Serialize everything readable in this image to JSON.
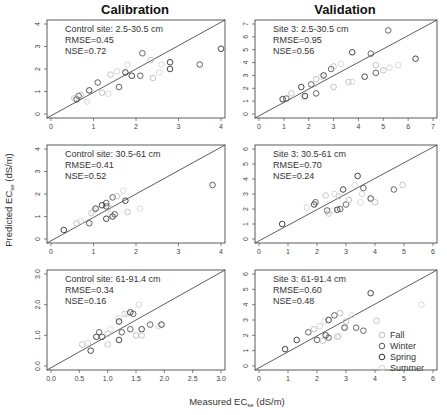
{
  "titles": {
    "left": "Calibration",
    "right": "Validation"
  },
  "axes": {
    "xlabel": "Measured EC",
    "xlabel_sub": "se",
    "xlabel_unit": " (dS/m)",
    "ylabel": "Predicted EC",
    "ylabel_sub": "se",
    "ylabel_unit": " (dS/m)"
  },
  "legend": [
    {
      "label": "Fall",
      "color": "#bdbdbd"
    },
    {
      "label": "Winter",
      "color": "#555555"
    },
    {
      "label": "Spring",
      "color": "#333333"
    },
    {
      "label": "Summer",
      "color": "#d5d5d5"
    }
  ],
  "chart_data": [
    {
      "type": "scatter",
      "id": "p1",
      "title": "Control site: 2.5-30.5 cm",
      "rmse": "RMSE=0.45",
      "nse": "NSE=0.72",
      "xlim": [
        0,
        4
      ],
      "ylim": [
        0,
        4
      ],
      "xticks": [
        "0",
        "1",
        "2",
        "3",
        "4"
      ],
      "yticks": [
        "0",
        "1",
        "2",
        "3",
        "4"
      ],
      "points": [
        [
          0.6,
          0.65
        ],
        [
          0.65,
          0.8
        ],
        [
          0.7,
          0.85
        ],
        [
          0.85,
          0.55
        ],
        [
          0.9,
          1.05
        ],
        [
          1.1,
          1.4
        ],
        [
          1.4,
          1.75
        ],
        [
          1.55,
          1.9
        ],
        [
          1.75,
          1.85
        ],
        [
          2.15,
          2.7
        ],
        [
          2.35,
          2.4
        ],
        [
          2.55,
          1.85
        ],
        [
          2.8,
          2.0
        ],
        [
          1.6,
          1.2
        ],
        [
          1.2,
          0.95
        ],
        [
          1.35,
          0.9
        ],
        [
          1.9,
          1.7
        ],
        [
          2.1,
          1.7
        ],
        [
          2.4,
          1.6
        ],
        [
          2.6,
          2.2
        ],
        [
          2.8,
          2.3
        ],
        [
          3.5,
          2.2
        ],
        [
          0.55,
          0.7
        ],
        [
          1.8,
          2.2
        ],
        [
          4.0,
          2.9
        ]
      ]
    },
    {
      "type": "scatter",
      "id": "p2",
      "title": "Site 3: 2.5-30.5 cm",
      "rmse": "RMSE=0.95",
      "nse": "NSE=0.56",
      "xlim": [
        0,
        7
      ],
      "ylim": [
        0,
        7
      ],
      "xticks": [
        "0",
        "1",
        "2",
        "3",
        "4",
        "5",
        "6",
        "7"
      ],
      "yticks": [
        "0",
        "1",
        "2",
        "3",
        "4",
        "5",
        "6",
        "7"
      ],
      "points": [
        [
          0.95,
          1.15
        ],
        [
          1.1,
          1.2
        ],
        [
          1.3,
          1.6
        ],
        [
          1.8,
          1.3
        ],
        [
          1.85,
          1.4
        ],
        [
          2.3,
          1.6
        ],
        [
          3.0,
          2.1
        ],
        [
          3.75,
          2.5
        ],
        [
          4.25,
          2.9
        ],
        [
          4.7,
          3.2
        ],
        [
          5.0,
          3.4
        ],
        [
          5.25,
          3.6
        ],
        [
          1.7,
          2.1
        ],
        [
          2.1,
          2.3
        ],
        [
          2.3,
          2.7
        ],
        [
          2.5,
          2.9
        ],
        [
          2.6,
          3.0
        ],
        [
          2.9,
          3.5
        ],
        [
          3.0,
          3.7
        ],
        [
          3.3,
          3.9
        ],
        [
          3.75,
          4.8
        ],
        [
          4.5,
          4.7
        ],
        [
          4.7,
          3.8
        ],
        [
          5.6,
          3.8
        ],
        [
          6.3,
          4.3
        ],
        [
          5.2,
          6.5
        ],
        [
          3.6,
          2.5
        ]
      ]
    },
    {
      "type": "scatter",
      "id": "p3",
      "title": "Control site: 30.5-61 cm",
      "rmse": "RMSE=0.41",
      "nse": "NSE=0.52",
      "xlim": [
        0,
        4
      ],
      "ylim": [
        0,
        4
      ],
      "xticks": [
        "0",
        "1",
        "2",
        "3",
        "4"
      ],
      "yticks": [
        "0",
        "1",
        "2",
        "3",
        "4"
      ],
      "points": [
        [
          0.3,
          0.4
        ],
        [
          0.9,
          0.7
        ],
        [
          0.95,
          1.15
        ],
        [
          1.0,
          1.25
        ],
        [
          1.05,
          1.35
        ],
        [
          1.3,
          1.6
        ],
        [
          1.35,
          1.4
        ],
        [
          1.4,
          1.1
        ],
        [
          1.45,
          1.0
        ],
        [
          1.45,
          1.85
        ],
        [
          1.55,
          1.9
        ],
        [
          1.7,
          2.15
        ],
        [
          1.75,
          1.7
        ],
        [
          1.3,
          1.45
        ],
        [
          0.6,
          0.7
        ],
        [
          0.7,
          0.8
        ],
        [
          1.3,
          0.9
        ],
        [
          1.5,
          1.1
        ],
        [
          1.8,
          1.2
        ],
        [
          2.1,
          1.35
        ],
        [
          1.2,
          1.5
        ],
        [
          3.8,
          2.4
        ]
      ]
    },
    {
      "type": "scatter",
      "id": "p4",
      "title": "Site 3: 30.5-61 cm",
      "rmse": "RMSE=0.70",
      "nse": "NSE=0.24",
      "xlim": [
        0,
        6
      ],
      "ylim": [
        0,
        6
      ],
      "xticks": [
        "0",
        "1",
        "2",
        "3",
        "4",
        "5",
        "6"
      ],
      "yticks": [
        "0",
        "1",
        "2",
        "3",
        "4",
        "5",
        "6"
      ],
      "points": [
        [
          0.8,
          1.0
        ],
        [
          2.35,
          1.9
        ],
        [
          2.4,
          1.7
        ],
        [
          2.55,
          1.9
        ],
        [
          2.7,
          1.95
        ],
        [
          2.8,
          2.0
        ],
        [
          2.75,
          2.85
        ],
        [
          3.5,
          2.45
        ],
        [
          3.85,
          2.7
        ],
        [
          4.65,
          3.3
        ],
        [
          4.95,
          3.6
        ],
        [
          1.65,
          2.1
        ],
        [
          1.9,
          2.3
        ],
        [
          1.95,
          2.45
        ],
        [
          2.3,
          2.9
        ],
        [
          2.6,
          3.0
        ],
        [
          2.9,
          3.3
        ],
        [
          3.0,
          2.3
        ],
        [
          3.1,
          2.6
        ],
        [
          3.3,
          3.6
        ],
        [
          3.4,
          4.2
        ],
        [
          3.6,
          3.4
        ],
        [
          4.0,
          2.45
        ],
        [
          3.55,
          3.0
        ]
      ]
    },
    {
      "type": "scatter",
      "id": "p5",
      "title": "Control site: 61-91.4 cm",
      "rmse": "RMSE=0.34",
      "nse": "NSE=0.16",
      "xlim": [
        0,
        3
      ],
      "ylim": [
        0,
        3
      ],
      "xticks": [
        "0.0",
        "0.5",
        "1.0",
        "1.5",
        "2.0",
        "2.5",
        "3.0"
      ],
      "yticks": [
        "0.0",
        "1.0",
        "2.0",
        "3.0"
      ],
      "points": [
        [
          0.8,
          0.95
        ],
        [
          0.85,
          1.1
        ],
        [
          1.0,
          0.7
        ],
        [
          1.2,
          1.55
        ],
        [
          1.2,
          1.45
        ],
        [
          1.25,
          1.1
        ],
        [
          1.3,
          1.7
        ],
        [
          1.35,
          1.7
        ],
        [
          1.4,
          1.75
        ],
        [
          1.45,
          1.7
        ],
        [
          1.5,
          1.0
        ],
        [
          1.55,
          2.0
        ],
        [
          1.6,
          1.2
        ],
        [
          1.75,
          1.35
        ],
        [
          0.55,
          0.7
        ],
        [
          0.65,
          0.75
        ],
        [
          0.7,
          0.5
        ],
        [
          0.9,
          0.95
        ],
        [
          1.0,
          1.05
        ],
        [
          1.05,
          1.2
        ],
        [
          1.2,
          0.85
        ],
        [
          1.4,
          1.2
        ],
        [
          1.6,
          1.0
        ],
        [
          1.9,
          1.3
        ],
        [
          1.95,
          1.35
        ]
      ]
    },
    {
      "type": "scatter",
      "id": "p6",
      "title": "Site 3: 61-91.4 cm",
      "rmse": "RMSE=0.60",
      "nse": "NSE=0.48",
      "xlim": [
        0,
        6
      ],
      "ylim": [
        0,
        6
      ],
      "xticks": [
        "0",
        "1",
        "2",
        "3",
        "4",
        "5",
        "6"
      ],
      "yticks": [
        "0",
        "1",
        "2",
        "3",
        "4",
        "5",
        "6"
      ],
      "points": [
        [
          0.9,
          1.1
        ],
        [
          2.0,
          1.7
        ],
        [
          2.2,
          1.65
        ],
        [
          2.25,
          2.9
        ],
        [
          2.3,
          2.0
        ],
        [
          2.4,
          1.85
        ],
        [
          2.7,
          1.9
        ],
        [
          2.75,
          1.95
        ],
        [
          2.95,
          2.5
        ],
        [
          3.35,
          2.5
        ],
        [
          4.05,
          2.95
        ],
        [
          5.6,
          4.0
        ],
        [
          1.3,
          1.7
        ],
        [
          1.7,
          2.2
        ],
        [
          1.9,
          2.4
        ],
        [
          2.1,
          2.6
        ],
        [
          2.4,
          3.0
        ],
        [
          2.6,
          3.3
        ],
        [
          2.8,
          3.45
        ],
        [
          3.2,
          3.3
        ],
        [
          3.85,
          4.75
        ],
        [
          3.6,
          2.3
        ],
        [
          3.0,
          2.9
        ]
      ]
    }
  ]
}
